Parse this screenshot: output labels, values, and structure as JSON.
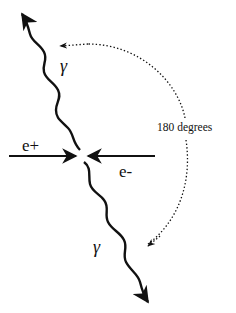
{
  "diagram": {
    "particles": {
      "positron": {
        "label": "e+"
      },
      "electron": {
        "label": "e-"
      },
      "photon_top": {
        "label": "γ"
      },
      "photon_bottom": {
        "label": "γ"
      }
    },
    "angle_annotation": {
      "label": "180 degrees"
    },
    "colors": {
      "ink": "#111111",
      "background": "#ffffff"
    }
  }
}
